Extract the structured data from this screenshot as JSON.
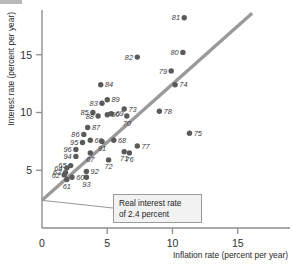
{
  "chart_data": {
    "type": "scatter",
    "title": "",
    "xlabel": "Inflation rate (percent per year)",
    "ylabel": "Interest rate (percent per year)",
    "xlim": [
      0,
      19
    ],
    "ylim": [
      0,
      19.5
    ],
    "xticks": [
      0,
      5,
      10,
      15
    ],
    "yticks": [
      5,
      10,
      15
    ],
    "xtick_labels": [
      "0",
      "5",
      "10",
      "15"
    ],
    "ytick_labels": [
      "5",
      "10",
      "15"
    ],
    "grid": false,
    "legend": null,
    "point_label_field": "year (two-digit)",
    "points": [
      {
        "label": "81",
        "x": 10.9,
        "y": 18.2
      },
      {
        "label": "80",
        "x": 10.8,
        "y": 15.2
      },
      {
        "label": "82",
        "x": 7.3,
        "y": 14.8
      },
      {
        "label": "79",
        "x": 9.9,
        "y": 13.6
      },
      {
        "label": "74",
        "x": 10.2,
        "y": 12.4
      },
      {
        "label": "84",
        "x": 4.5,
        "y": 12.4
      },
      {
        "label": "89",
        "x": 5.0,
        "y": 11.1
      },
      {
        "label": "83",
        "x": 4.6,
        "y": 10.8
      },
      {
        "label": "73",
        "x": 6.3,
        "y": 10.3
      },
      {
        "label": "78",
        "x": 9.0,
        "y": 10.1
      },
      {
        "label": "85",
        "x": 3.9,
        "y": 10.0
      },
      {
        "label": "69",
        "x": 5.3,
        "y": 9.9
      },
      {
        "label": "90",
        "x": 5.0,
        "y": 9.8
      },
      {
        "label": "88",
        "x": 4.3,
        "y": 9.7
      },
      {
        "label": "70",
        "x": 6.5,
        "y": 9.7
      },
      {
        "label": "87",
        "x": 3.5,
        "y": 8.7
      },
      {
        "label": "86",
        "x": 3.2,
        "y": 8.1
      },
      {
        "label": "75",
        "x": 11.3,
        "y": 8.2
      },
      {
        "label": "66",
        "x": 3.7,
        "y": 7.6
      },
      {
        "label": "68",
        "x": 5.5,
        "y": 7.6
      },
      {
        "label": "95",
        "x": 3.1,
        "y": 7.4
      },
      {
        "label": "91",
        "x": 4.6,
        "y": 7.5
      },
      {
        "label": "77",
        "x": 7.3,
        "y": 7.1
      },
      {
        "label": "96",
        "x": 2.6,
        "y": 6.8
      },
      {
        "label": "67",
        "x": 3.7,
        "y": 6.5
      },
      {
        "label": "71",
        "x": 6.3,
        "y": 6.6
      },
      {
        "label": "76",
        "x": 6.7,
        "y": 6.5
      },
      {
        "label": "94",
        "x": 2.6,
        "y": 6.2
      },
      {
        "label": "72",
        "x": 5.1,
        "y": 5.9
      },
      {
        "label": "65",
        "x": 2.2,
        "y": 5.4
      },
      {
        "label": "64",
        "x": 1.9,
        "y": 5.2
      },
      {
        "label": "92",
        "x": 3.4,
        "y": 4.9
      },
      {
        "label": "63",
        "x": 1.8,
        "y": 4.8
      },
      {
        "label": "62",
        "x": 1.7,
        "y": 4.6
      },
      {
        "label": "93",
        "x": 3.4,
        "y": 4.4
      },
      {
        "label": "60",
        "x": 2.3,
        "y": 4.4
      },
      {
        "label": "61",
        "x": 1.9,
        "y": 4.2
      }
    ],
    "fit_line": {
      "name": "Real interest rate line",
      "intercept": 2.4,
      "slope": 1.0,
      "x_start": 0.0,
      "y_start": 2.4,
      "x_end": 16.1,
      "y_end": 18.6
    },
    "annotation": {
      "line1": "Real interest rate",
      "line2": "of 2.4 percent",
      "value": 2.4,
      "anchor_x": 0.0,
      "anchor_y": 2.4
    }
  },
  "colors": {
    "dot": "#5a5a5a",
    "fit_line": "#9a9a9a",
    "axis": "#8e8e8e",
    "annotation_bg": "#f2f2f2",
    "annotation_border": "#9b9b9b",
    "text": "#1f1f1f",
    "background": "#ffffff"
  }
}
